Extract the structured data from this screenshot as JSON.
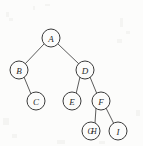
{
  "figure": {
    "kind": "binary-tree-diagram",
    "width": 143,
    "height": 146,
    "background_color": "#fcfcfb",
    "node_stroke_color": "#3a3a3a",
    "edge_stroke_color": "#4a4a4a",
    "label_color": "#2b2b2b"
  },
  "nodes": [
    {
      "id": "A",
      "label": "A",
      "cx": 51,
      "cy": 38,
      "r": 9
    },
    {
      "id": "B",
      "label": "B",
      "cx": 19,
      "cy": 70,
      "r": 9
    },
    {
      "id": "D",
      "label": "D",
      "cx": 85,
      "cy": 70,
      "r": 9
    },
    {
      "id": "C",
      "label": "C",
      "cx": 36,
      "cy": 101,
      "r": 9
    },
    {
      "id": "E",
      "label": "E",
      "cx": 72,
      "cy": 101,
      "r": 9
    },
    {
      "id": "F",
      "label": "F",
      "cx": 101,
      "cy": 101,
      "r": 9
    },
    {
      "id": "GH",
      "label": "GH",
      "cx": 91,
      "cy": 131,
      "r": 9
    },
    {
      "id": "I",
      "label": "I",
      "cx": 118,
      "cy": 131,
      "r": 9
    }
  ],
  "edges": [
    {
      "from": "A",
      "to": "B",
      "x1": 44,
      "y1": 44,
      "x2": 25,
      "y2": 64
    },
    {
      "from": "A",
      "to": "D",
      "x1": 58,
      "y1": 44,
      "x2": 79,
      "y2": 64
    },
    {
      "from": "B",
      "to": "C",
      "x1": 24,
      "y1": 77,
      "x2": 31,
      "y2": 94
    },
    {
      "from": "D",
      "to": "E",
      "x1": 80,
      "y1": 77,
      "x2": 76,
      "y2": 94
    },
    {
      "from": "D",
      "to": "F",
      "x1": 90,
      "y1": 77,
      "x2": 97,
      "y2": 94
    },
    {
      "from": "F",
      "to": "GH",
      "x1": 96,
      "y1": 108,
      "x2": 95,
      "y2": 123
    },
    {
      "from": "F",
      "to": "I",
      "x1": 106,
      "y1": 108,
      "x2": 114,
      "y2": 124
    }
  ]
}
